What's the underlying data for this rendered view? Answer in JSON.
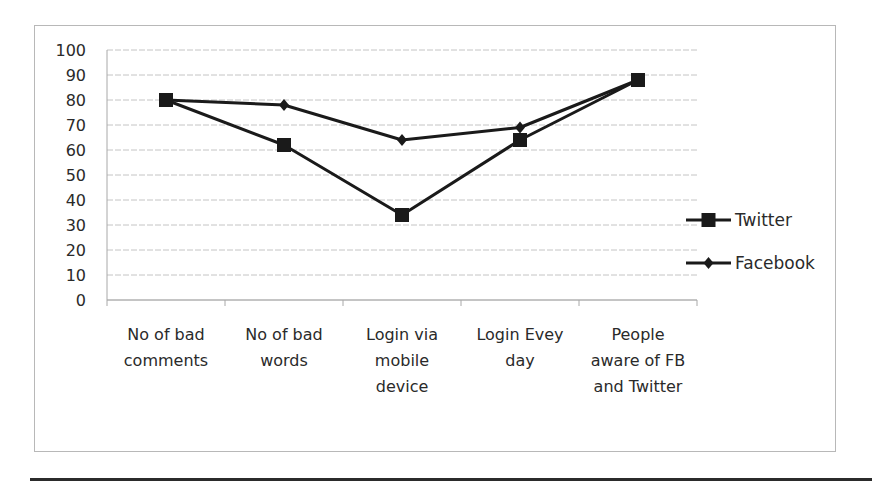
{
  "chart_data": {
    "type": "line",
    "title": "",
    "xlabel": "",
    "ylabel": "",
    "ylim": [
      0,
      100
    ],
    "yticks": [
      0,
      10,
      20,
      30,
      40,
      50,
      60,
      70,
      80,
      90,
      100
    ],
    "grid": true,
    "legend_position": "right",
    "categories": [
      [
        "No of bad",
        "comments"
      ],
      [
        "No of bad",
        "words"
      ],
      [
        "Login via",
        "mobile",
        "device"
      ],
      [
        "Login Evey",
        "day"
      ],
      [
        "People",
        "aware of FB",
        "and Twitter"
      ]
    ],
    "series": [
      {
        "name": "Twitter",
        "marker": "square",
        "color": "#1a1a1a",
        "values": [
          80,
          62,
          34,
          64,
          88
        ]
      },
      {
        "name": "Facebook",
        "marker": "diamond",
        "color": "#1a1a1a",
        "values": [
          80,
          78,
          64,
          69,
          88
        ]
      }
    ]
  }
}
